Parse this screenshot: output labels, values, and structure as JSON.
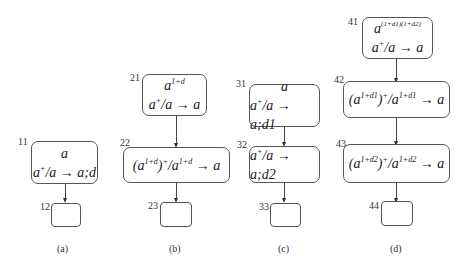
{
  "figures": [
    {
      "caption": "(a)",
      "nodes": [
        {
          "id": "11",
          "line1": "a",
          "line2_base": "a",
          "line2_sup": "+",
          "line2_rest": "/a → a;d"
        },
        {
          "id": "12",
          "empty": true
        }
      ]
    },
    {
      "caption": "(b)",
      "nodes": [
        {
          "id": "21",
          "line1_base": "a",
          "line1_sup": "1+d",
          "line2_base": "a",
          "line2_sup": "+",
          "line2_rest": "/a → a"
        },
        {
          "id": "22",
          "expr_open": "(a",
          "expr_sup1": "1+d",
          "expr_mid": ")",
          "expr_sup2": "+",
          "expr_slash": "/a",
          "expr_sup3": "1+d",
          "expr_rest": " → a"
        },
        {
          "id": "23",
          "empty": true
        }
      ]
    },
    {
      "caption": "(c)",
      "nodes": [
        {
          "id": "31",
          "line1": "a",
          "line2_base": "a",
          "line2_sup": "+",
          "line2_rest": "/a → a;d1"
        },
        {
          "id": "32",
          "line2_base": "a",
          "line2_sup": "+",
          "line2_rest": "/a → a;d2"
        },
        {
          "id": "33",
          "empty": true
        }
      ]
    },
    {
      "caption": "(d)",
      "nodes": [
        {
          "id": "41",
          "line1_base": "a",
          "line1_sup": "(1+d1)(1+d2)",
          "line2_base": "a",
          "line2_sup": "+",
          "line2_rest": "/a → a"
        },
        {
          "id": "42",
          "expr_open": "(a",
          "expr_sup1": "1+d1",
          "expr_mid": ")",
          "expr_sup2": "+",
          "expr_slash": "/a",
          "expr_sup3": "1+d1",
          "expr_rest": " → a"
        },
        {
          "id": "43",
          "expr_open": "(a",
          "expr_sup1": "1+d2",
          "expr_mid": ")",
          "expr_sup2": "+",
          "expr_slash": "/a",
          "expr_sup3": "1+d2",
          "expr_rest": " → a"
        },
        {
          "id": "44",
          "empty": true
        }
      ]
    }
  ]
}
